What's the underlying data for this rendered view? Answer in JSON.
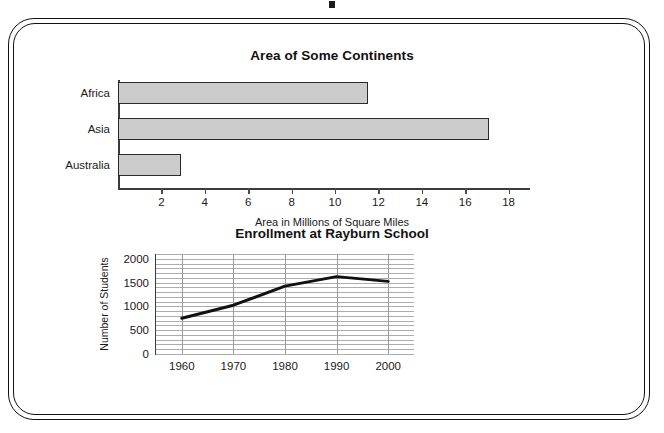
{
  "worksheet": {
    "frame": "rounded-double-border",
    "background_color": "#ffffff",
    "border_color": "#111111"
  },
  "chart_data": [
    {
      "type": "bar",
      "orientation": "horizontal",
      "title": "Area of Some Continents",
      "xlabel": "Area in Millions of Square Miles",
      "ylabel": "",
      "categories": [
        "Africa",
        "Asia",
        "Australia"
      ],
      "values": [
        11.5,
        17.1,
        2.9
      ],
      "xlim": [
        0,
        18.8
      ],
      "xticks": [
        2,
        4,
        6,
        8,
        10,
        12,
        14,
        16,
        18
      ],
      "xtick_labels": [
        "2",
        "4",
        "6",
        "8",
        "10",
        "12",
        "14",
        "16",
        "18"
      ],
      "grid": false,
      "bar_fill": "#cccccc",
      "bar_stroke": "#2a2a2a",
      "axis_color": "#3b3b3b"
    },
    {
      "type": "line",
      "title": "Enrollment at Rayburn School",
      "xlabel": "",
      "ylabel": "Number of Students",
      "x": [
        1960,
        1970,
        1980,
        1990,
        2000
      ],
      "xtick_labels": [
        "1960",
        "1970",
        "1980",
        "1990",
        "2000"
      ],
      "values": [
        750,
        1025,
        1425,
        1625,
        1525
      ],
      "ylim": [
        0,
        2100
      ],
      "yticks": [
        0,
        500,
        1000,
        1500,
        2000
      ],
      "ytick_labels": [
        "0",
        "500",
        "1000",
        "1500",
        "2000"
      ],
      "xlim": [
        1955,
        2005
      ],
      "grid": true,
      "grid_minor_step": 100,
      "grid_color": "#adadad",
      "line_color": "#111111",
      "line_width": 3,
      "legend": null
    }
  ]
}
